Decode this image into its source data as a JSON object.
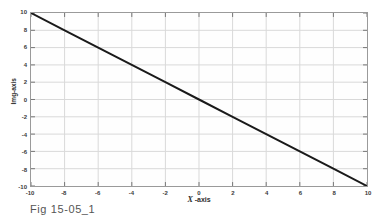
{
  "figure": {
    "caption": "Fig 15-05_1"
  },
  "axes": {
    "x_title_prefix": "X",
    "x_title_suffix": " -axis",
    "y_title": "Img-axis"
  },
  "chart_data": {
    "type": "line",
    "title": "",
    "subtitle": "",
    "xlabel": "X -axis",
    "ylabel": "Img-axis",
    "xlim": [
      -10,
      10
    ],
    "ylim": [
      -10,
      10
    ],
    "xticks": [
      -10,
      -8,
      -6,
      -4,
      -2,
      0,
      2,
      4,
      6,
      8,
      10
    ],
    "xticklabels": [
      "-10",
      "-8",
      "-6",
      "-4",
      "-2",
      "0",
      "2",
      "4",
      "6",
      "8",
      "10"
    ],
    "yticks": [
      10,
      8,
      6,
      4,
      2,
      0,
      -2,
      -4,
      -6,
      -8,
      -10
    ],
    "yticklabels": [
      "10",
      "8",
      "6",
      "4",
      "2",
      "0",
      "-2",
      "-4",
      "-6",
      "-8",
      "-10"
    ],
    "grid": true,
    "grid_color": "#d9d9d9",
    "legend": false,
    "legend_position": "none",
    "line_color": "#1a1a1a",
    "line_width": 2,
    "series": [
      {
        "name": "line",
        "x": [
          -10,
          -8,
          -6,
          -4,
          -2,
          0,
          2,
          4,
          6,
          8,
          10
        ],
        "values": [
          10,
          8,
          6,
          4,
          2,
          0,
          -2,
          -4,
          -6,
          -8,
          -10
        ]
      }
    ],
    "annotations": []
  }
}
